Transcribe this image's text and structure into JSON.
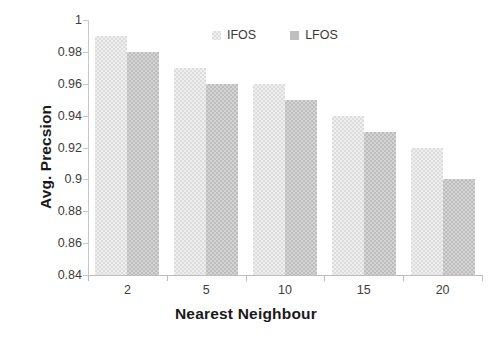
{
  "chart_data": {
    "type": "bar",
    "title": "",
    "subtitle": "",
    "xlabel": "Nearest Neighbour",
    "ylabel": "Avg. Precsion",
    "categories": [
      "2",
      "5",
      "10",
      "15",
      "20"
    ],
    "series": [
      {
        "name": "IFOS",
        "values": [
          0.99,
          0.97,
          0.96,
          0.94,
          0.92
        ],
        "color": "#efefef"
      },
      {
        "name": "LFOS",
        "values": [
          0.98,
          0.96,
          0.95,
          0.93,
          0.9
        ],
        "color": "#bfbfbf"
      }
    ],
    "ylim": [
      0.84,
      1
    ],
    "ytick_values": [
      1,
      0.98,
      0.96,
      0.94,
      0.92,
      0.9,
      0.88,
      0.86,
      0.84
    ],
    "ytick_labels": [
      "1",
      "0.98",
      "0.96",
      "0.94",
      "0.92",
      "0.9",
      "0.88",
      "0.86",
      "0.84"
    ],
    "grid": false,
    "legend_position": "top-center"
  },
  "legend": {
    "entries": [
      {
        "label": "IFOS"
      },
      {
        "label": "LFOS"
      }
    ]
  },
  "axes": {
    "y_title": "Avg. Precsion",
    "x_title": "Nearest Neighbour"
  }
}
